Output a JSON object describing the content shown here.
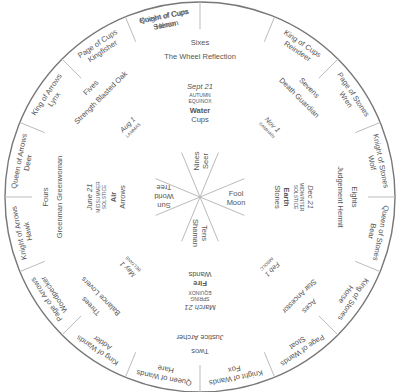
{
  "colors": {
    "line": "#777777",
    "text": "#555555",
    "bold_text": "#222222",
    "spoke": "#bbbbbb"
  },
  "court_cards": [
    {
      "suit_card": "Queen of Cups",
      "animal": "Heron",
      "angle": -11.25
    },
    {
      "suit_card": "King of Cups",
      "animal": "Reindeer",
      "angle": 33.75
    },
    {
      "suit_card": "Page of Stones",
      "animal": "Wren",
      "angle": 56.25
    },
    {
      "suit_card": "Knight of Stones",
      "animal": "Wolf",
      "angle": 78.75
    },
    {
      "suit_card": "Queen of Stones",
      "animal": "Bear",
      "angle": 101.25
    },
    {
      "suit_card": "King of Stones",
      "animal": "Horse",
      "angle": 123.75
    },
    {
      "suit_card": "Page of Wands",
      "animal": "Stoat",
      "angle": 146.25
    },
    {
      "suit_card": "Knight of Wands",
      "animal": "Fox",
      "angle": 168.75
    },
    {
      "suit_card": "Queen of Wands",
      "animal": "Hare",
      "angle": 191.25
    },
    {
      "suit_card": "King of Wands",
      "animal": "Adder",
      "angle": 213.75
    },
    {
      "suit_card": "Page of Arrows",
      "animal": "Woodpecker",
      "angle": 236.25
    },
    {
      "suit_card": "Knight of Arrows",
      "animal": "Hawk",
      "angle": 258.75
    },
    {
      "suit_card": "Queen of Arrows",
      "animal": "Deer",
      "angle": 281.25
    },
    {
      "suit_card": "King of Arrows",
      "animal": "Lynx",
      "angle": 303.75
    },
    {
      "suit_card": "Page of Cups",
      "animal": "Kingfisher",
      "angle": 326.25
    },
    {
      "suit_card": "Knight of Cups",
      "animal": "Salmon",
      "angle": 348.75
    }
  ],
  "number_cards": [
    {
      "number": "Sixes",
      "major": "The Wheel Reflection",
      "angle": 0
    },
    {
      "number": "Sevens",
      "major": "Death Guardian",
      "angle": 45
    },
    {
      "number": "Eights",
      "major": "Judgement Hermit",
      "angle": 90
    },
    {
      "number": "Aces",
      "major": "Star Ancestor",
      "angle": 135
    },
    {
      "number": "Twos",
      "major": "Justice Archer",
      "angle": 180
    },
    {
      "number": "Threes",
      "major": "Balance Lovers",
      "angle": 225
    },
    {
      "number": "Fours",
      "major": "Greenman Greenwoman",
      "angle": 270
    },
    {
      "number": "Fives",
      "major": "Strength Blasted Oak",
      "angle": 315
    }
  ],
  "seasons": [
    {
      "date": "Sept 21",
      "event1": "AUTUMN",
      "event2": "EQUINOX",
      "element": "Water",
      "suit": "Cups",
      "angle": 0
    },
    {
      "date": "Dec 21",
      "event1": "MIDWINTER",
      "event2": "SOLSTICE",
      "element": "Earth",
      "suit": "Stones",
      "angle": 90
    },
    {
      "date": "March 21",
      "event1": "SPRING",
      "event2": "EQUINOX",
      "element": "Fire",
      "suit": "Wands",
      "angle": 180
    },
    {
      "date": "June 21",
      "event1": "MIDSUMMER",
      "event2": "SOLSTICE",
      "element": "Air",
      "suit": "Arrows",
      "angle": 270
    }
  ],
  "cross_quarters": [
    {
      "date": "Nov 1",
      "festival": "SAMHAIN",
      "angle": 45
    },
    {
      "date": "Feb 1",
      "festival": "IMBOLC",
      "angle": 135
    },
    {
      "date": "May 1",
      "festival": "BELTANE",
      "angle": 225
    },
    {
      "date": "Aug 1",
      "festival": "LAMMAS",
      "angle": 315
    }
  ],
  "center_cards": [
    {
      "line1": "Nines",
      "line2": "Seer",
      "angle": 0
    },
    {
      "line1": "Fool",
      "line2": "Moon",
      "angle": 90
    },
    {
      "line1": "Tens",
      "line2": "Shaman",
      "angle": 180
    },
    {
      "line1": "Sun",
      "line2": "World",
      "line3": "Tree",
      "angle": 270
    }
  ]
}
